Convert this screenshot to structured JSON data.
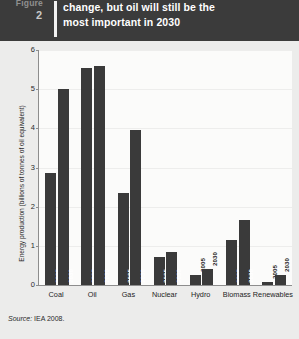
{
  "header": {
    "figure_word": "Figure",
    "figure_number": "2",
    "title_line1": "change, but oil will still be the",
    "title_line2": "most important in 2030",
    "background_color": "#3b3b3b",
    "title_color": "#ffffff"
  },
  "source": {
    "label": "Source:",
    "text": " IEA 2008."
  },
  "chart_data": {
    "type": "bar",
    "title": "change, but oil will still be the most important in 2030",
    "xlabel": "",
    "ylabel": "Energy production (billions of tonnes of oil equivalent)",
    "ylim": [
      0,
      6
    ],
    "yticks": [
      "0",
      "1",
      "2",
      "3",
      "4",
      "5",
      "6"
    ],
    "grid": true,
    "legend": "none",
    "bar_color": "#3a3a3a",
    "plot_background": "#fbfbfa",
    "categories": [
      "Coal",
      "Oil",
      "Gas",
      "Nuclear",
      "Hydro",
      "Biomass",
      "Renewables"
    ],
    "series": [
      {
        "name": "2005",
        "values": [
          2.85,
          5.55,
          2.35,
          0.72,
          0.25,
          1.15,
          0.08
        ]
      },
      {
        "name": "2030",
        "values": [
          5.0,
          5.6,
          3.95,
          0.85,
          0.42,
          1.65,
          0.25
        ]
      }
    ],
    "bar_labels": [
      {
        "category": "Coal",
        "series": "2005",
        "text": "2005",
        "inside": true
      },
      {
        "category": "Coal",
        "series": "2030",
        "text": "2030",
        "inside": true
      },
      {
        "category": "Oil",
        "series": "2005",
        "text": "2005",
        "inside": true
      },
      {
        "category": "Oil",
        "series": "2030",
        "text": "2030",
        "inside": true
      },
      {
        "category": "Gas",
        "series": "2005",
        "text": "2005",
        "inside": true
      },
      {
        "category": "Gas",
        "series": "2030",
        "text": "2030",
        "inside": true
      },
      {
        "category": "Nuclear",
        "series": "2005",
        "text": "2005",
        "inside": true
      },
      {
        "category": "Nuclear",
        "series": "2030",
        "text": "2030",
        "inside": true
      },
      {
        "category": "Hydro",
        "series": "2005",
        "text": "2005",
        "inside": false
      },
      {
        "category": "Hydro",
        "series": "2030",
        "text": "2030",
        "inside": false
      },
      {
        "category": "Biomass",
        "series": "2005",
        "text": "2005",
        "inside": true
      },
      {
        "category": "Biomass",
        "series": "2030",
        "text": "2030",
        "inside": true
      },
      {
        "category": "Renewables",
        "series": "2005",
        "text": "2005",
        "inside": false
      },
      {
        "category": "Renewables",
        "series": "2030",
        "text": "2030",
        "inside": false
      }
    ]
  }
}
